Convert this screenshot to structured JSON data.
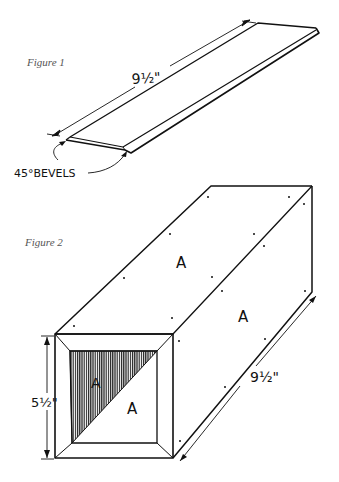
{
  "figure1": {
    "caption": "Figure 1",
    "dimension_label": "9½\"",
    "callout_label": "45°BEVELS"
  },
  "figure2": {
    "caption": "Figure 2",
    "height_label": "5½\"",
    "length_label": "9½\"",
    "panel_labels": [
      "A",
      "A",
      "A",
      "A"
    ]
  },
  "colors": {
    "ink": "#111111",
    "caption": "#555555",
    "background": "#ffffff"
  }
}
